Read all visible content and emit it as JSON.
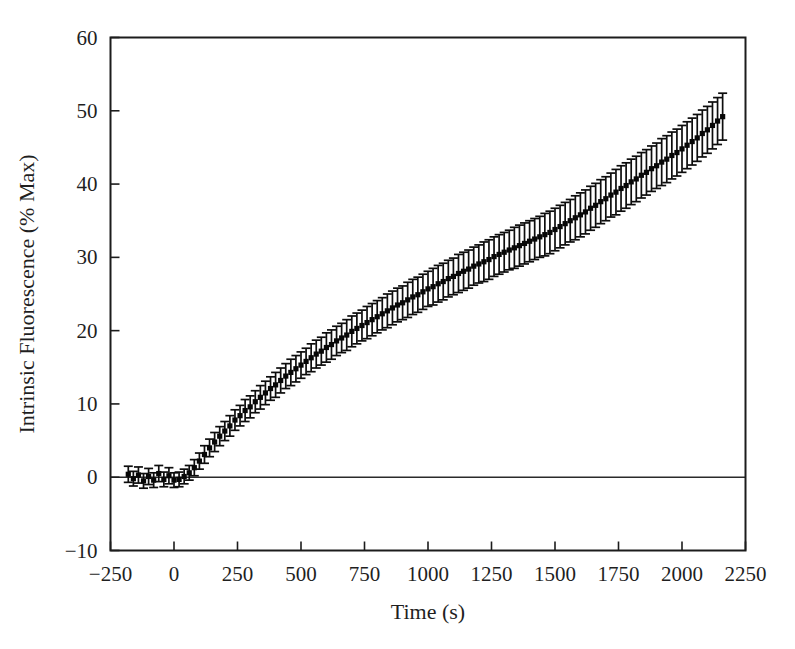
{
  "chart_data": {
    "type": "scatter",
    "title": "",
    "xlabel": "Time (s)",
    "ylabel": "Intrinsic Fluorescence (% Max)",
    "xlim": [
      -250,
      2250
    ],
    "ylim": [
      -10,
      60
    ],
    "xticks": [
      -250,
      0,
      250,
      500,
      750,
      1000,
      1250,
      1500,
      1750,
      2000,
      2250
    ],
    "xticklabels": [
      "-250",
      "0",
      "250",
      "500",
      "750",
      "1000",
      "1250",
      "1500",
      "1750",
      "2000",
      "2250"
    ],
    "yticks": [
      -10,
      0,
      10,
      20,
      30,
      40,
      50,
      60
    ],
    "yticklabels": [
      "-10",
      "0",
      "10",
      "20",
      "30",
      "40",
      "50",
      "60"
    ],
    "grid": false,
    "legend": null,
    "marker": "filled-square",
    "marker_color": "#070707",
    "errorbars": true,
    "errorbar_style": "capped",
    "zero_reference_line": true,
    "series": [
      {
        "name": "Intrinsic Fluorescence",
        "x": [
          -180,
          -160,
          -140,
          -120,
          -100,
          -80,
          -60,
          -40,
          -20,
          0,
          20,
          40,
          60,
          80,
          100,
          120,
          140,
          160,
          180,
          200,
          220,
          240,
          260,
          280,
          300,
          320,
          340,
          360,
          380,
          400,
          420,
          440,
          460,
          480,
          500,
          520,
          540,
          560,
          580,
          600,
          620,
          640,
          660,
          680,
          700,
          720,
          740,
          760,
          780,
          800,
          820,
          840,
          860,
          880,
          900,
          920,
          940,
          960,
          980,
          1000,
          1020,
          1040,
          1060,
          1080,
          1100,
          1120,
          1140,
          1160,
          1180,
          1200,
          1220,
          1240,
          1260,
          1280,
          1300,
          1320,
          1340,
          1360,
          1380,
          1400,
          1420,
          1440,
          1460,
          1480,
          1500,
          1520,
          1540,
          1560,
          1580,
          1600,
          1620,
          1640,
          1660,
          1680,
          1700,
          1720,
          1740,
          1760,
          1780,
          1800,
          1820,
          1840,
          1860,
          1880,
          1900,
          1920,
          1940,
          1960,
          1980,
          2000,
          2020,
          2040,
          2060,
          2080,
          2100,
          2120,
          2140,
          2160
        ],
        "y": [
          0.4,
          -0.2,
          0.3,
          -0.5,
          0.1,
          -0.4,
          0.5,
          -0.3,
          0.2,
          -0.4,
          -0.3,
          0.1,
          0.6,
          1.3,
          2.2,
          3.1,
          4.0,
          4.8,
          5.6,
          6.3,
          7.0,
          7.8,
          8.4,
          9.1,
          9.6,
          10.3,
          10.9,
          11.5,
          12.1,
          12.6,
          13.2,
          13.8,
          14.3,
          14.8,
          15.3,
          15.8,
          16.3,
          16.8,
          17.2,
          17.7,
          18.1,
          18.6,
          19.0,
          19.4,
          19.9,
          20.3,
          20.7,
          21.1,
          21.5,
          21.9,
          22.3,
          22.7,
          23.1,
          23.5,
          23.8,
          24.2,
          24.6,
          24.9,
          25.3,
          25.7,
          26.0,
          26.4,
          26.7,
          27.1,
          27.4,
          27.8,
          28.1,
          28.4,
          28.8,
          29.1,
          29.4,
          29.7,
          30.1,
          30.4,
          30.7,
          31.0,
          31.3,
          31.6,
          31.9,
          32.2,
          32.5,
          32.8,
          33.1,
          33.4,
          33.8,
          34.2,
          34.6,
          35.0,
          35.4,
          35.8,
          36.2,
          36.7,
          37.1,
          37.6,
          38.0,
          38.5,
          38.9,
          39.4,
          39.8,
          40.3,
          40.7,
          41.2,
          41.6,
          42.1,
          42.5,
          43.0,
          43.4,
          43.9,
          44.3,
          44.8,
          45.3,
          45.8,
          46.3,
          46.9,
          47.4,
          48.0,
          48.6,
          49.2
        ],
        "yerr": [
          1.1,
          1.0,
          1.1,
          1.0,
          1.1,
          1.0,
          1.1,
          1.0,
          1.1,
          1.0,
          1.0,
          1.0,
          1.0,
          1.1,
          1.1,
          1.2,
          1.2,
          1.3,
          1.3,
          1.3,
          1.4,
          1.4,
          1.4,
          1.5,
          1.5,
          1.5,
          1.6,
          1.6,
          1.6,
          1.7,
          1.7,
          1.7,
          1.8,
          1.8,
          1.8,
          1.8,
          1.9,
          1.9,
          1.9,
          2.0,
          2.0,
          2.0,
          2.0,
          2.1,
          2.1,
          2.1,
          2.1,
          2.2,
          2.2,
          2.2,
          2.2,
          2.3,
          2.3,
          2.3,
          2.3,
          2.4,
          2.4,
          2.4,
          2.4,
          2.4,
          2.5,
          2.5,
          2.5,
          2.5,
          2.5,
          2.6,
          2.6,
          2.6,
          2.6,
          2.6,
          2.7,
          2.7,
          2.7,
          2.7,
          2.7,
          2.7,
          2.8,
          2.8,
          2.8,
          2.8,
          2.8,
          2.8,
          2.9,
          2.9,
          2.9,
          2.9,
          2.9,
          2.9,
          3.0,
          3.0,
          3.0,
          3.0,
          3.0,
          3.0,
          3.0,
          3.0,
          3.1,
          3.1,
          3.1,
          3.1,
          3.1,
          3.1,
          3.1,
          3.1,
          3.1,
          3.2,
          3.2,
          3.2,
          3.2,
          3.2,
          3.2,
          3.2,
          3.2,
          3.2,
          3.2,
          3.2,
          3.2,
          3.2
        ]
      }
    ]
  }
}
